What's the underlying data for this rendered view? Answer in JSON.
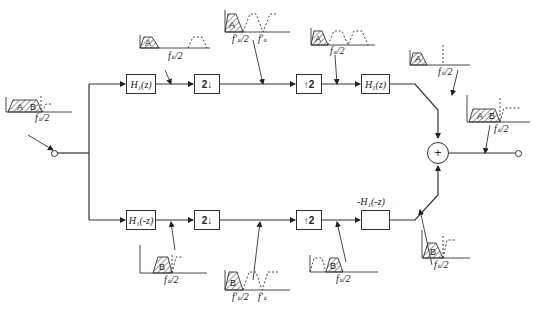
{
  "diagram": {
    "type": "two-band QMF filter bank block diagram",
    "upper_branch": {
      "analysis_filter": "H₁(z)",
      "decimator": "2↓",
      "interpolator": "↑2",
      "synthesis_filter": "H₁(z)"
    },
    "lower_branch": {
      "analysis_filter": "H₁(-z)",
      "decimator": "2↓",
      "interpolator": "↑2",
      "synthesis_filter_label": "-H₁(-z)"
    },
    "summing_node": "+",
    "spectra": {
      "input": {
        "bands": [
          "A",
          "B"
        ],
        "freq_label": "fₛ/2"
      },
      "upper_after_filter": {
        "bands": [
          "A"
        ],
        "freq_label": "fₛ/2"
      },
      "upper_after_decimation": {
        "bands": [
          "A"
        ],
        "freq_labels": [
          "f′ₛ/2",
          "f′ₛ"
        ]
      },
      "upper_after_interpolation": {
        "bands": [
          "A"
        ],
        "freq_label": "fₛ/2"
      },
      "upper_after_synthesis": {
        "bands": [
          "A"
        ],
        "freq_label": "fₛ/2"
      },
      "output": {
        "bands": [
          "A",
          "B"
        ],
        "freq_label": "fₛ/2"
      },
      "lower_after_filter": {
        "bands": [
          "B"
        ],
        "freq_label": "fₛ/2"
      },
      "lower_after_decimation": {
        "bands": [
          "B"
        ],
        "freq_labels": [
          "f′ₛ/2",
          "f′ₛ"
        ]
      },
      "lower_after_interpolation": {
        "bands": [
          "B"
        ],
        "freq_label": "fₛ/2"
      },
      "lower_after_synthesis": {
        "bands": [
          "B"
        ],
        "freq_label": "fₛ/2"
      }
    }
  }
}
